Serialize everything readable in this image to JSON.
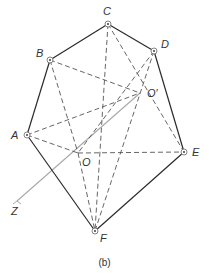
{
  "figure": {
    "caption": "(b)",
    "colors": {
      "solid_edge": "#2b2b2b",
      "dashed_edge": "#555555",
      "axis": "#a8a8a8",
      "vertex_ring": "#666666",
      "label": "#333333"
    },
    "vertices": [
      {
        "id": "A",
        "label": "A",
        "x": 27,
        "y": 135,
        "lx": 11,
        "ly": 139
      },
      {
        "id": "B",
        "label": "B",
        "x": 50,
        "y": 60,
        "lx": 36,
        "ly": 57
      },
      {
        "id": "C",
        "label": "C",
        "x": 108,
        "y": 24,
        "lx": 103,
        "ly": 15
      },
      {
        "id": "D",
        "label": "D",
        "x": 154,
        "y": 51,
        "lx": 161,
        "ly": 48
      },
      {
        "id": "E",
        "label": "E",
        "x": 184,
        "y": 152,
        "lx": 192,
        "ly": 156
      },
      {
        "id": "F",
        "label": "F",
        "x": 95,
        "y": 231,
        "lx": 100,
        "ly": 242
      }
    ],
    "points": [
      {
        "id": "O",
        "label": "O",
        "x": 78,
        "y": 153,
        "lx": 82,
        "ly": 166
      },
      {
        "id": "Oprime",
        "label": "O′",
        "x": 140,
        "y": 93,
        "lx": 147,
        "ly": 97
      },
      {
        "id": "Z",
        "label": "Z",
        "x": 17,
        "y": 201,
        "lx": 11,
        "ly": 215
      }
    ],
    "solid_edges": [
      [
        "A",
        "B"
      ],
      [
        "B",
        "C"
      ],
      [
        "C",
        "D"
      ],
      [
        "D",
        "E"
      ],
      [
        "E",
        "F"
      ],
      [
        "F",
        "A"
      ]
    ],
    "dashed_edges": [
      [
        "B",
        "Oprime"
      ],
      [
        "B",
        "O"
      ],
      [
        "A",
        "Oprime"
      ],
      [
        "A",
        "O"
      ],
      [
        "C",
        "F"
      ],
      [
        "C",
        "E"
      ],
      [
        "D",
        "O"
      ],
      [
        "D",
        "F"
      ],
      [
        "O",
        "E"
      ],
      [
        "O",
        "F"
      ]
    ],
    "axis": {
      "from": "Oprime",
      "to": "Z",
      "label": "Z"
    }
  }
}
